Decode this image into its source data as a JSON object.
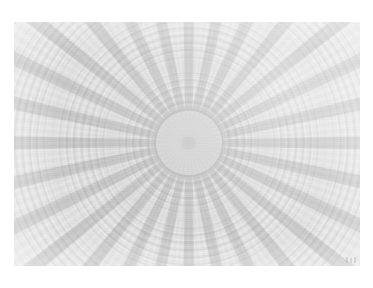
{
  "page": {
    "background_color": "#ffffff",
    "width": 373,
    "height": 288
  },
  "photo": {
    "subject": "coffered dome interior viewed from below",
    "alt_text": "Coffered dome interior with radial ribs converging on a central circular oculus",
    "plate_left": 14,
    "plate_top": 22,
    "plate_width": 346,
    "plate_height": 244,
    "tone": "low-contrast desaturated grayscale",
    "palette": {
      "page_white": "#ffffff",
      "plate_light": "#e2e2e2",
      "plate_mid": "#d8d8d8",
      "plate_dark": "#cdcdcd",
      "rib_gray": "#b9b9b9",
      "oculus_gray": "#c2c2c2",
      "oculus_core": "#b0b0b0",
      "coffer_shadow": "#929292"
    },
    "structure": {
      "rib_count": 28,
      "coffer_ring_count": 26,
      "center_x_pct": 50.5,
      "center_y_pct": 49.5,
      "oculus_radius_px": 33,
      "oculus_core_radius_px": 7,
      "highlight_direction": "upper-right"
    },
    "corner_mark": "faint-emulsion-mark",
    "caption": ""
  }
}
